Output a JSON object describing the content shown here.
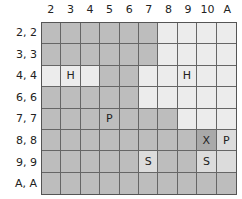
{
  "columns": [
    "2",
    "3",
    "4",
    "5",
    "6",
    "7",
    "8",
    "9",
    "10",
    "A"
  ],
  "rows": [
    {
      "label": "2, 2",
      "cells": [
        {
          "shade": "d",
          "text": ""
        },
        {
          "shade": "d",
          "text": ""
        },
        {
          "shade": "d",
          "text": ""
        },
        {
          "shade": "d",
          "text": ""
        },
        {
          "shade": "d",
          "text": ""
        },
        {
          "shade": "d",
          "text": ""
        },
        {
          "shade": "l",
          "text": ""
        },
        {
          "shade": "l",
          "text": ""
        },
        {
          "shade": "l",
          "text": ""
        },
        {
          "shade": "l",
          "text": ""
        }
      ]
    },
    {
      "label": "3, 3",
      "cells": [
        {
          "shade": "d",
          "text": ""
        },
        {
          "shade": "d",
          "text": ""
        },
        {
          "shade": "d",
          "text": ""
        },
        {
          "shade": "d",
          "text": ""
        },
        {
          "shade": "d",
          "text": ""
        },
        {
          "shade": "d",
          "text": ""
        },
        {
          "shade": "l",
          "text": ""
        },
        {
          "shade": "l",
          "text": ""
        },
        {
          "shade": "l",
          "text": ""
        },
        {
          "shade": "l",
          "text": ""
        }
      ]
    },
    {
      "label": "4, 4",
      "cells": [
        {
          "shade": "l",
          "text": ""
        },
        {
          "shade": "l",
          "text": "H"
        },
        {
          "shade": "l",
          "text": ""
        },
        {
          "shade": "d",
          "text": ""
        },
        {
          "shade": "d",
          "text": ""
        },
        {
          "shade": "l",
          "text": ""
        },
        {
          "shade": "l",
          "text": ""
        },
        {
          "shade": "l",
          "text": "H"
        },
        {
          "shade": "l",
          "text": ""
        },
        {
          "shade": "l",
          "text": ""
        }
      ]
    },
    {
      "label": "6, 6",
      "cells": [
        {
          "shade": "d",
          "text": ""
        },
        {
          "shade": "d",
          "text": ""
        },
        {
          "shade": "d",
          "text": ""
        },
        {
          "shade": "d",
          "text": ""
        },
        {
          "shade": "d",
          "text": ""
        },
        {
          "shade": "l",
          "text": ""
        },
        {
          "shade": "l",
          "text": ""
        },
        {
          "shade": "l",
          "text": ""
        },
        {
          "shade": "l",
          "text": ""
        },
        {
          "shade": "l",
          "text": ""
        }
      ]
    },
    {
      "label": "7, 7",
      "cells": [
        {
          "shade": "d",
          "text": ""
        },
        {
          "shade": "d",
          "text": ""
        },
        {
          "shade": "d",
          "text": ""
        },
        {
          "shade": "d",
          "text": "P"
        },
        {
          "shade": "d",
          "text": ""
        },
        {
          "shade": "d",
          "text": ""
        },
        {
          "shade": "d",
          "text": ""
        },
        {
          "shade": "l",
          "text": ""
        },
        {
          "shade": "l",
          "text": ""
        },
        {
          "shade": "l",
          "text": ""
        }
      ]
    },
    {
      "label": "8, 8",
      "cells": [
        {
          "shade": "d",
          "text": ""
        },
        {
          "shade": "d",
          "text": ""
        },
        {
          "shade": "d",
          "text": ""
        },
        {
          "shade": "d",
          "text": ""
        },
        {
          "shade": "d",
          "text": ""
        },
        {
          "shade": "d",
          "text": ""
        },
        {
          "shade": "d",
          "text": ""
        },
        {
          "shade": "d",
          "text": ""
        },
        {
          "shade": "x",
          "text": "X"
        },
        {
          "shade": "m",
          "text": "P"
        }
      ]
    },
    {
      "label": "9, 9",
      "cells": [
        {
          "shade": "d",
          "text": ""
        },
        {
          "shade": "d",
          "text": ""
        },
        {
          "shade": "d",
          "text": ""
        },
        {
          "shade": "d",
          "text": ""
        },
        {
          "shade": "d",
          "text": ""
        },
        {
          "shade": "m",
          "text": "S"
        },
        {
          "shade": "d",
          "text": ""
        },
        {
          "shade": "d",
          "text": ""
        },
        {
          "shade": "m",
          "text": "S"
        },
        {
          "shade": "m",
          "text": ""
        }
      ]
    },
    {
      "label": "A, A",
      "cells": [
        {
          "shade": "d",
          "text": ""
        },
        {
          "shade": "d",
          "text": ""
        },
        {
          "shade": "d",
          "text": ""
        },
        {
          "shade": "d",
          "text": ""
        },
        {
          "shade": "d",
          "text": ""
        },
        {
          "shade": "d",
          "text": ""
        },
        {
          "shade": "d",
          "text": ""
        },
        {
          "shade": "d",
          "text": ""
        },
        {
          "shade": "d",
          "text": ""
        },
        {
          "shade": "d",
          "text": ""
        }
      ]
    }
  ],
  "legend_codes": {
    "H": "H",
    "P": "P",
    "S": "S",
    "X": "X"
  },
  "colors": {
    "dark": "#bdbdbd",
    "light": "#ececec",
    "darker": "#a9a9a9",
    "mid": "#dcdcdc",
    "grid_line": "#666666"
  }
}
